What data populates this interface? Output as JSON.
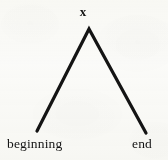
{
  "figure": {
    "type": "line-diagram",
    "background_color": "#fbfbf9",
    "stroke_color": "#141414",
    "apex_label": "x",
    "left_label": "beginning",
    "right_label": "end",
    "geometry": {
      "apex": [
        89,
        29
      ],
      "left_foot": [
        37,
        131
      ],
      "right_foot": [
        146,
        133
      ],
      "stroke_width": 3.2
    }
  },
  "chart_data": {
    "type": "line",
    "title": "",
    "xlabel": "",
    "ylabel": "",
    "categories": [
      "beginning",
      "x",
      "end"
    ],
    "x": [
      37,
      89,
      146
    ],
    "values": [
      131,
      29,
      133
    ],
    "annotations": [
      {
        "text": "x",
        "x": 89,
        "y": 18
      },
      {
        "text": "beginning",
        "x": 8,
        "y": 152
      },
      {
        "text": "end",
        "x": 133,
        "y": 152
      }
    ],
    "grid": false,
    "legend": "none",
    "xlim": [
      0,
      168
    ],
    "ylim": [
      0,
      160
    ]
  }
}
